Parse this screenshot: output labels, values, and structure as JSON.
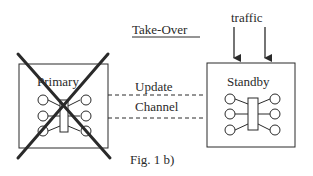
{
  "figure": {
    "caption": "Fig. 1 b)",
    "title": "Take-Over",
    "input_label": "traffic"
  },
  "nodes": {
    "primary": {
      "label": "Primary",
      "state": "failed"
    },
    "standby": {
      "label": "Standby",
      "state": "active"
    }
  },
  "link": {
    "line1": "Update",
    "line2": "Channel"
  },
  "colors": {
    "stroke": "#2a2a2a",
    "background": "#ffffff"
  }
}
